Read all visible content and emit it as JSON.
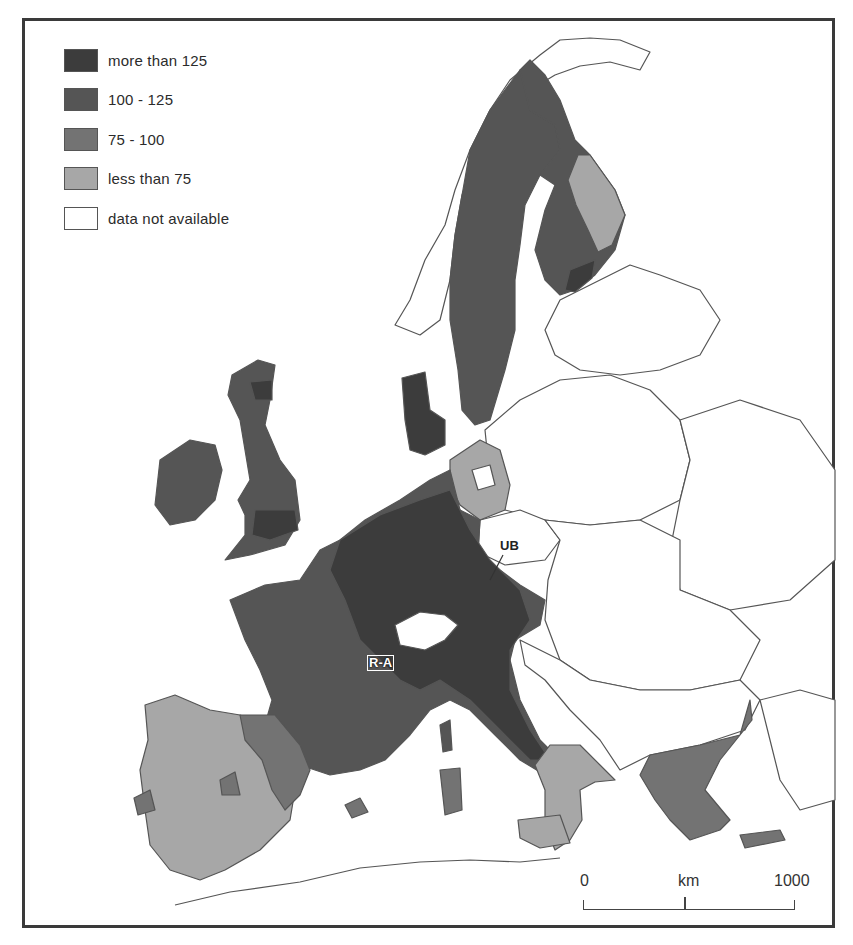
{
  "legend": {
    "items": [
      {
        "label": "more than 125",
        "color": "#3c3c3c"
      },
      {
        "label": "100 - 125",
        "color": "#555555"
      },
      {
        "label": "75 - 100",
        "color": "#737373"
      },
      {
        "label": "less than 75",
        "color": "#a7a7a7"
      },
      {
        "label": "data not available",
        "color": "#ffffff"
      }
    ]
  },
  "scale_bar": {
    "start": "0",
    "unit": "km",
    "end": "1000"
  },
  "map_labels": {
    "ub": "UB",
    "ra": "R-A"
  },
  "colors": {
    "frame": "#3a3a3a",
    "border_lines": "#555555",
    "background": "#ffffff"
  }
}
